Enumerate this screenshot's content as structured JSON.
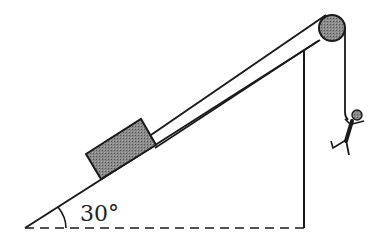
{
  "diagram": {
    "angle_label": "30°",
    "colors": {
      "stroke": "#1a1a1a",
      "fill_gray": "#7a7a7a",
      "background": "#ffffff"
    },
    "elements": [
      {
        "name": "incline",
        "type": "right-triangle",
        "angle_deg": 30
      },
      {
        "name": "block",
        "type": "rectangle",
        "on": "incline"
      },
      {
        "name": "rope",
        "type": "line",
        "from": "block",
        "to": "pulley"
      },
      {
        "name": "pulley",
        "type": "circle",
        "at": "top-of-incline"
      },
      {
        "name": "person",
        "type": "hanging-figure",
        "hangs_from": "pulley"
      },
      {
        "name": "ground",
        "type": "dashed-line"
      }
    ]
  }
}
